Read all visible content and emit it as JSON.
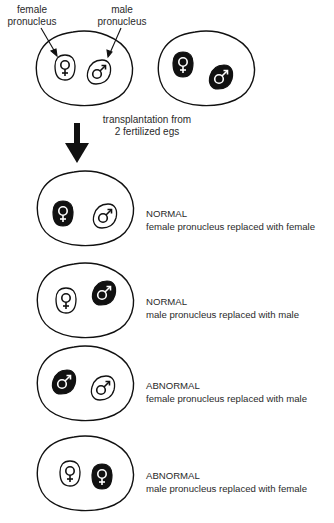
{
  "top": {
    "female_label_line1": "female",
    "female_label_line2": "pronucleus",
    "male_label_line1": "male",
    "male_label_line2": "pronucleus",
    "transplant_line1": "transplantation from",
    "transplant_line2": "2 fertilized egs",
    "egg1": {
      "female": "outline",
      "male": "outline"
    },
    "egg2": {
      "female": "filled",
      "male": "filled"
    }
  },
  "results": [
    {
      "status": "NORMAL",
      "description": "female pronucleus replaced with female",
      "left": {
        "symbol": "female",
        "style": "filled"
      },
      "right": {
        "symbol": "male",
        "style": "outline"
      }
    },
    {
      "status": "NORMAL",
      "description": "male pronucleus replaced with male",
      "left": {
        "symbol": "female",
        "style": "outline"
      },
      "right": {
        "symbol": "male",
        "style": "filled"
      }
    },
    {
      "status": "ABNORMAL",
      "description": "female pronucleus replaced with male",
      "left": {
        "symbol": "male",
        "style": "filled"
      },
      "right": {
        "symbol": "male",
        "style": "outline"
      }
    },
    {
      "status": "ABNORMAL",
      "description": "male pronucleus replaced with female",
      "left": {
        "symbol": "female",
        "style": "outline"
      },
      "right": {
        "symbol": "female",
        "style": "filled"
      }
    }
  ],
  "icons": {
    "female_symbol": "♀",
    "male_symbol": "♂"
  },
  "colors": {
    "ink": "#111111",
    "text": "#2a2a2a",
    "background": "#ffffff"
  }
}
